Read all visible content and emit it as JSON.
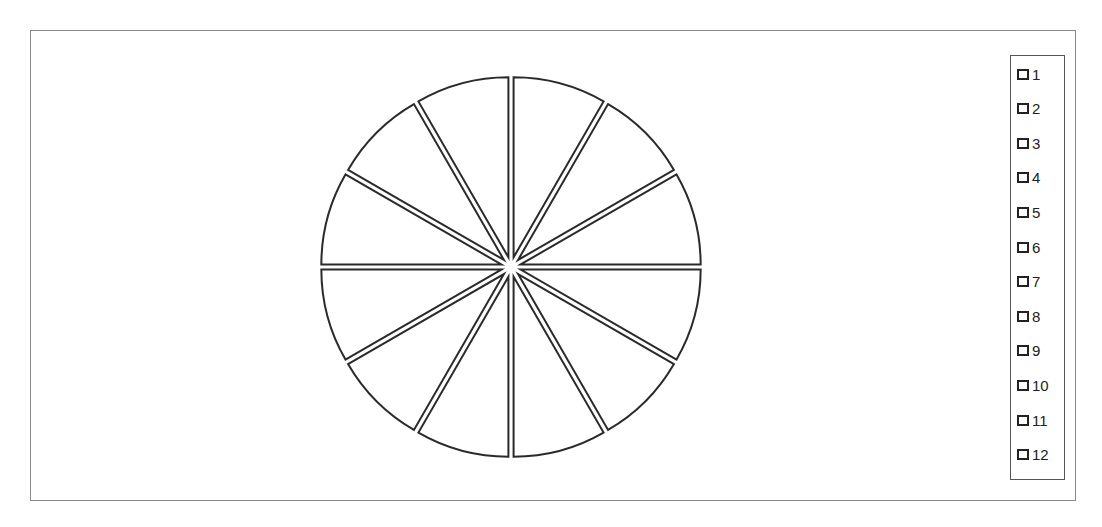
{
  "chart_data": {
    "type": "pie",
    "title": "",
    "labels": [
      "1",
      "2",
      "3",
      "4",
      "5",
      "6",
      "7",
      "8",
      "9",
      "10",
      "11",
      "12"
    ],
    "values": [
      1,
      1,
      1,
      1,
      1,
      1,
      1,
      1,
      1,
      1,
      1,
      1
    ],
    "exploded": true,
    "start_angle": "12 o'clock, clockwise",
    "slice_fill": "#ffffff",
    "slice_stroke": "#2a2a2a",
    "legend_position": "right"
  },
  "legend": {
    "items": [
      {
        "label": "1"
      },
      {
        "label": "2"
      },
      {
        "label": "3"
      },
      {
        "label": "4"
      },
      {
        "label": "5"
      },
      {
        "label": "6"
      },
      {
        "label": "7"
      },
      {
        "label": "8"
      },
      {
        "label": "9"
      },
      {
        "label": "10"
      },
      {
        "label": "11"
      },
      {
        "label": "12"
      }
    ]
  }
}
